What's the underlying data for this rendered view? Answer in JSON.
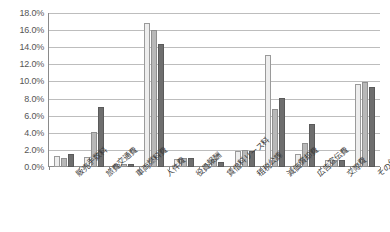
{
  "chart_data": {
    "type": "bar",
    "title": "",
    "xlabel": "",
    "ylabel": "",
    "ylim": [
      0,
      18
    ],
    "ytick_step": 2,
    "grid": true,
    "legend": "none",
    "ytick_labels": [
      "18.0%",
      "16.0%",
      "14.0%",
      "12.0%",
      "10.0%",
      "8.0%",
      "6.0%",
      "4.0%",
      "2.0%",
      "0.0%"
    ],
    "categories": [
      "販売手数料",
      "旅費交通費",
      "車両燃料費",
      "人件費",
      "役員報酬",
      "賃借料リース料",
      "租税公課",
      "減価償却費",
      "広告宣伝費",
      "交際費",
      "その他"
    ],
    "series": [
      {
        "name": "series-1",
        "color": "#ededed",
        "values": [
          1.3,
          1.2,
          0.3,
          16.8,
          0.9,
          0.3,
          1.9,
          13.1,
          1.5,
          0.8,
          9.7
        ]
      },
      {
        "name": "series-2",
        "color": "#b8b8b8",
        "values": [
          1.0,
          4.1,
          0.3,
          16.0,
          1.0,
          0.9,
          2.0,
          6.8,
          2.8,
          0.8,
          9.9
        ]
      },
      {
        "name": "series-3",
        "color": "#6e6e6e",
        "values": [
          1.5,
          7.0,
          0.3,
          14.4,
          1.0,
          0.6,
          1.9,
          8.1,
          5.0,
          0.8,
          9.4
        ]
      }
    ]
  }
}
